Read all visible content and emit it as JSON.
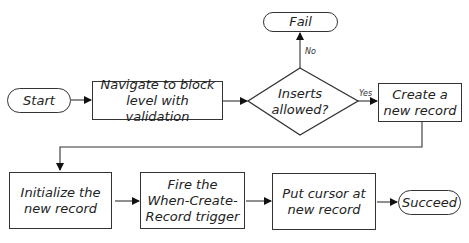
{
  "diagram": {
    "type": "flowchart",
    "nodes": {
      "start": "Start",
      "navigate": "Navigate to block level with validation",
      "decision": "Inserts allowed?",
      "fail": "Fail",
      "create": "Create a new record",
      "initialize": "Initialize the new record",
      "fire": "Fire the When-Create-Record trigger",
      "put_cursor": "Put cursor at new record",
      "succeed": "Succeed"
    },
    "edge_labels": {
      "no": "No",
      "yes": "Yes"
    },
    "edges": [
      [
        "Start",
        "Navigate to block level with validation"
      ],
      [
        "Navigate to block level with validation",
        "Inserts allowed?"
      ],
      [
        "Inserts allowed?",
        "Fail",
        "No"
      ],
      [
        "Inserts allowed?",
        "Create a new record",
        "Yes"
      ],
      [
        "Create a new record",
        "Initialize the new record"
      ],
      [
        "Initialize the new record",
        "Fire the When-Create-Record trigger"
      ],
      [
        "Fire the When-Create-Record trigger",
        "Put cursor at new record"
      ],
      [
        "Put cursor at new record",
        "Succeed"
      ]
    ]
  }
}
